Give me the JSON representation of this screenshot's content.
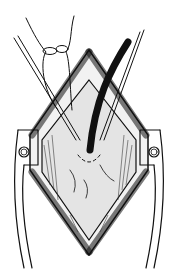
{
  "figure": {
    "type": "surgical-illustration",
    "colors": {
      "ink": "#111111",
      "background": "#ffffff",
      "tissue": "#dcdcdc"
    },
    "elements": [
      {
        "name": "incision-wound",
        "shape": "diamond"
      },
      {
        "name": "retractor-left"
      },
      {
        "name": "retractor-right"
      },
      {
        "name": "drain-tube"
      },
      {
        "name": "suture-loop"
      },
      {
        "name": "suture-needles"
      }
    ]
  }
}
